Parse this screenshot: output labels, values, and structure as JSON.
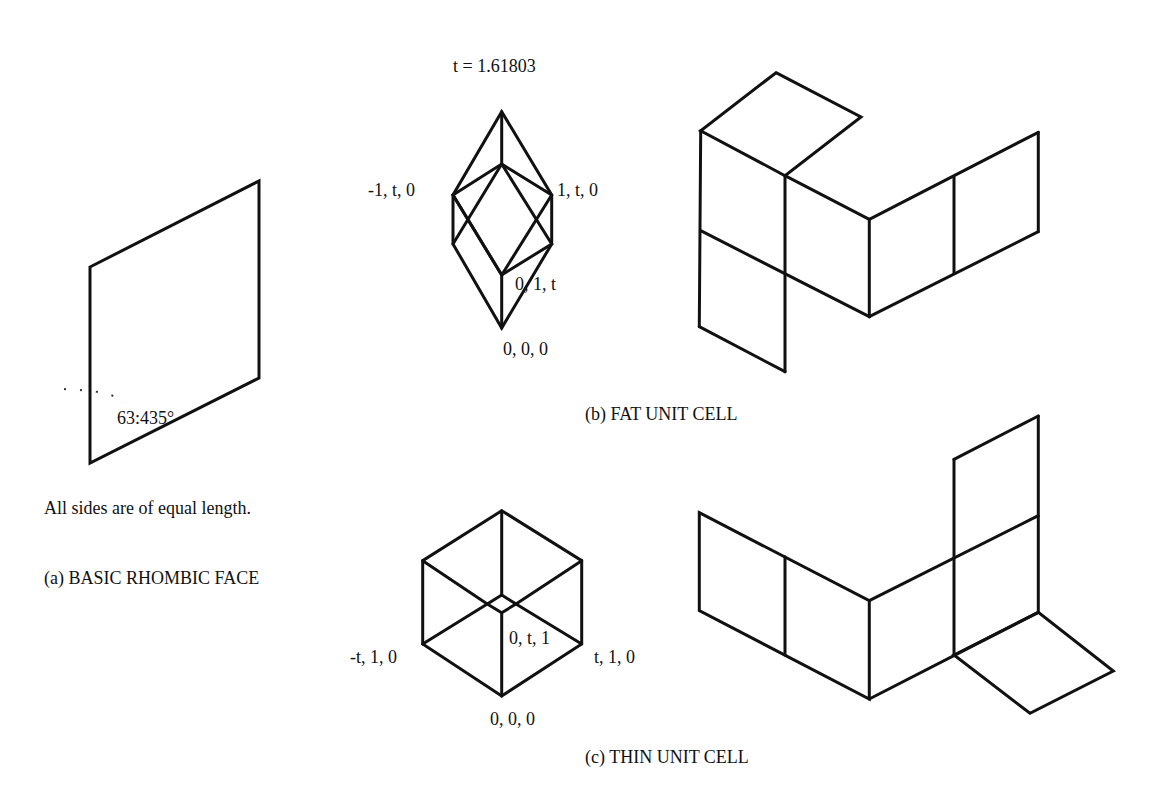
{
  "figure": {
    "golden_ratio_label": "t = 1.61803",
    "panel_a": {
      "note": "All sides are of equal length.",
      "caption": "(a) BASIC RHOMBIC FACE",
      "angle_label": "63:435°"
    },
    "panel_b": {
      "caption": "(b) FAT UNIT CELL",
      "vertex_labels": {
        "left": "-1, t, 0",
        "right": "1, t, 0",
        "inner": "0, 1, t",
        "origin": "0, 0, 0"
      }
    },
    "panel_c": {
      "caption": "(c) THIN UNIT CELL",
      "vertex_labels": {
        "left": "-t, 1, 0",
        "right": "t, 1, 0",
        "inner": "0, t, 1",
        "origin": "0, 0, 0"
      }
    }
  }
}
